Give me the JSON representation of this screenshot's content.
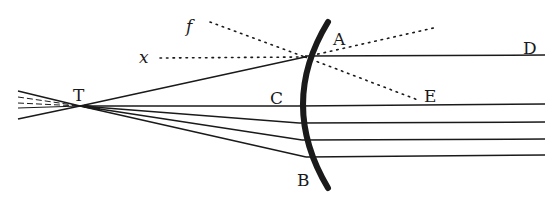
{
  "figure": {
    "type": "optics-diagram",
    "ink_color": "#1a1a1a",
    "background": "#ffffff",
    "labels": {
      "A": "A",
      "B": "B",
      "C": "C",
      "D": "D",
      "E": "E",
      "T": "T",
      "x": "x",
      "f": "f"
    },
    "points": {
      "T": [
        80,
        106
      ],
      "A": [
        305,
        57
      ],
      "C": [
        297,
        106
      ],
      "B": [
        306,
        157
      ],
      "D": [
        545,
        55
      ],
      "E": [
        420,
        100
      ],
      "x": [
        155,
        58
      ],
      "f": [
        205,
        22
      ]
    },
    "rays": [
      {
        "from": "T",
        "mirror_y": 57,
        "end_x": 545
      },
      {
        "from": "T",
        "mirror_y": 106,
        "end_x": 545
      },
      {
        "from": "T",
        "mirror_y": 123,
        "end_x": 545
      },
      {
        "from": "T",
        "mirror_y": 140,
        "end_x": 545
      },
      {
        "from": "T",
        "mirror_y": 157,
        "end_x": 545
      }
    ]
  }
}
